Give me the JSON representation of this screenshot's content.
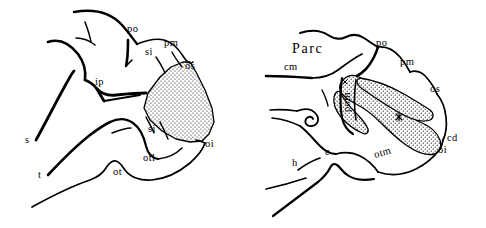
{
  "figure": {
    "background_color": "#ffffff",
    "ink_color": "#000000",
    "panel_count": 2
  },
  "left_panel": {
    "name": "left-brain-diagram",
    "shaded_region_label": "stippled-region",
    "labels": [
      {
        "id": "po",
        "text": "po",
        "x": 127,
        "y": 32,
        "rotation": 0
      },
      {
        "id": "pm",
        "text": "pm",
        "x": 164,
        "y": 46,
        "rotation": 0
      },
      {
        "id": "si1",
        "text": "si",
        "x": 145,
        "y": 55,
        "rotation": 0
      },
      {
        "id": "os",
        "text": "os",
        "x": 185,
        "y": 69,
        "rotation": 0
      },
      {
        "id": "ip",
        "text": "ip",
        "x": 95,
        "y": 85,
        "rotation": 0
      },
      {
        "id": "si2",
        "text": "si",
        "x": 148,
        "y": 132,
        "rotation": 0
      },
      {
        "id": "oi",
        "text": "oi",
        "x": 205,
        "y": 147,
        "rotation": 0
      },
      {
        "id": "otl",
        "text": "otl",
        "x": 143,
        "y": 161,
        "rotation": 0
      },
      {
        "id": "ot",
        "text": "ot",
        "x": 113,
        "y": 175,
        "rotation": 0
      },
      {
        "id": "s",
        "text": "s",
        "x": 25,
        "y": 143,
        "rotation": 0
      },
      {
        "id": "t",
        "text": "t",
        "x": 38,
        "y": 178,
        "rotation": 0
      }
    ]
  },
  "right_panel": {
    "name": "right-brain-diagram",
    "shaded_region_label": "stippled-region",
    "labels": [
      {
        "id": "Parc",
        "text": "Parc",
        "x": 292,
        "y": 53,
        "rotation": 0,
        "size": "big"
      },
      {
        "id": "cm",
        "text": "cm",
        "x": 284,
        "y": 70,
        "rotation": 0
      },
      {
        "id": "po",
        "text": "po",
        "x": 376,
        "y": 46,
        "rotation": 0
      },
      {
        "id": "pm",
        "text": "pm",
        "x": 400,
        "y": 65,
        "rotation": 0
      },
      {
        "id": "os",
        "text": "os",
        "x": 430,
        "y": 92,
        "rotation": 0
      },
      {
        "id": "pom",
        "text": "pom",
        "x": 350,
        "y": 112,
        "rotation": -90
      },
      {
        "id": "cd",
        "text": "cd",
        "x": 447,
        "y": 141,
        "rotation": 0
      },
      {
        "id": "oi",
        "text": "oi",
        "x": 438,
        "y": 153,
        "rotation": 0
      },
      {
        "id": "otm",
        "text": "otm",
        "x": 375,
        "y": 158,
        "rotation": -16
      },
      {
        "id": "c",
        "text": "c",
        "x": 325,
        "y": 155,
        "rotation": 0
      },
      {
        "id": "h",
        "text": "h",
        "x": 292,
        "y": 166,
        "rotation": 0
      }
    ]
  }
}
